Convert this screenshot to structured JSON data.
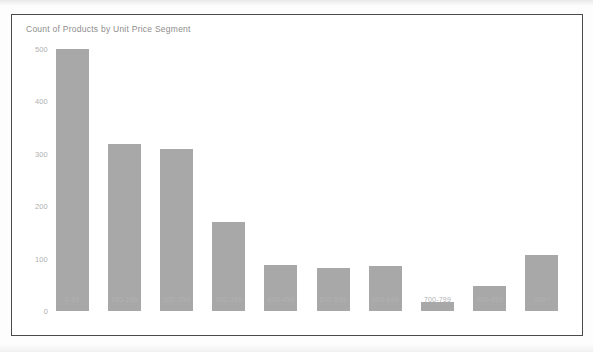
{
  "chart_data": {
    "type": "bar",
    "title": "Count of Products by Unit Price Segment",
    "xlabel": "",
    "ylabel": "",
    "categories": [
      "0-99",
      "100-199",
      "200-299",
      "300-399",
      "400-499",
      "500-599",
      "600-699",
      "700-799",
      "800-899",
      "900+"
    ],
    "values": [
      500,
      318,
      310,
      170,
      88,
      82,
      85,
      18,
      47,
      107
    ],
    "ylim": [
      0,
      500
    ],
    "yticks": [
      0,
      100,
      200,
      300,
      400,
      500
    ],
    "ytick_labels": [
      "0",
      "100",
      "200",
      "300",
      "400",
      "500"
    ],
    "grid": false,
    "legend": false,
    "bar_color": "#a8a8a8",
    "axis_text_color": "#b0b0b0",
    "title_color": "#8d8d8d",
    "frame_color": "#4a4a4a"
  }
}
